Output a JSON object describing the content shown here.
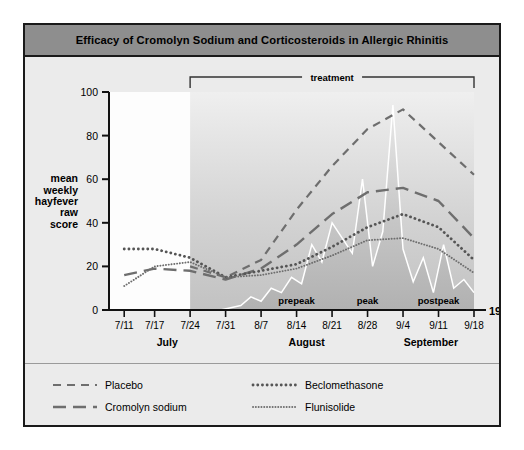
{
  "title": "Efficacy of Cromolyn Sodium and Corticosteroids in Allergic Rhinitis",
  "year_label": "1984",
  "treatment_label": "treatment",
  "y_axis_title_lines": [
    "mean",
    "weekly",
    "hayfever",
    "raw",
    "score"
  ],
  "annotations": [
    {
      "name": "prepeak",
      "label": "prepeak",
      "x": "8/14"
    },
    {
      "name": "peak",
      "label": "peak",
      "x": "8/28"
    },
    {
      "name": "postpeak",
      "label": "postpeak",
      "x": "9/11"
    }
  ],
  "months": [
    {
      "label": "July",
      "start": "7/8",
      "end": "7/31"
    },
    {
      "label": "August",
      "start": "8/1",
      "end": "8/31"
    },
    {
      "label": "September",
      "start": "9/1",
      "end": "9/18"
    }
  ],
  "legend": [
    {
      "name": "Placebo",
      "style": "dashed",
      "color": "#6e6e6e"
    },
    {
      "name": "Beclomethasone",
      "style": "thick-dotted",
      "color": "#5a5a5a"
    },
    {
      "name": "Cromolyn sodium",
      "style": "long-dash",
      "color": "#6e6e6e"
    },
    {
      "name": "Flunisolide",
      "style": "fine-dotted",
      "color": "#6e6e6e"
    }
  ],
  "colors": {
    "frame": "#1a1a1a",
    "titlebar": "#8e8e8e",
    "panel": "#ebebeb",
    "plot_background": "#fdfdfd",
    "pollen_fill": "#b9b9b9",
    "pollen_line": "#ffffff",
    "axis": "#111111"
  },
  "chart_data": {
    "type": "line",
    "title": "Efficacy of Cromolyn Sodium and Corticosteroids in Allergic Rhinitis",
    "xlabel": "1984",
    "ylabel": "mean weekly hayfever raw score",
    "ylim": [
      0,
      100
    ],
    "yticks": [
      0,
      20,
      40,
      60,
      80,
      100
    ],
    "grid": false,
    "legend_position": "below",
    "xlim": [
      "7/8",
      "9/18"
    ],
    "xticks": [
      "7/11",
      "7/17",
      "7/24",
      "7/31",
      "8/7",
      "8/14",
      "8/21",
      "8/28",
      "9/4",
      "9/11",
      "9/18"
    ],
    "x": [
      "7/11",
      "7/17",
      "7/24",
      "7/31",
      "8/7",
      "8/14",
      "8/21",
      "8/28",
      "9/4",
      "9/11",
      "9/18"
    ],
    "series": [
      {
        "name": "Placebo",
        "style": "dashed",
        "x": [
          "7/24",
          "7/31",
          "8/7",
          "8/14",
          "8/21",
          "8/28",
          "9/4",
          "9/11",
          "9/18"
        ],
        "values": [
          20,
          15,
          23,
          46,
          66,
          83,
          92,
          77,
          62
        ]
      },
      {
        "name": "Cromolyn sodium",
        "style": "long-dash",
        "x": [
          "7/11",
          "7/17",
          "7/24",
          "7/31",
          "8/7",
          "8/14",
          "8/21",
          "8/28",
          "9/4",
          "9/11",
          "9/18"
        ],
        "values": [
          16,
          19,
          18,
          14,
          19,
          30,
          44,
          54,
          56,
          50,
          33
        ]
      },
      {
        "name": "Beclomethasone",
        "style": "thick-dotted",
        "x": [
          "7/11",
          "7/17",
          "7/24",
          "7/31",
          "8/7",
          "8/14",
          "8/21",
          "8/28",
          "9/4",
          "9/11",
          "9/18"
        ],
        "values": [
          28,
          28,
          24,
          15,
          18,
          21,
          29,
          38,
          44,
          38,
          23
        ]
      },
      {
        "name": "Flunisolide",
        "style": "fine-dotted",
        "x": [
          "7/11",
          "7/17",
          "7/24",
          "7/31",
          "8/7",
          "8/14",
          "8/21",
          "8/28",
          "9/4",
          "9/11",
          "9/18"
        ],
        "values": [
          11,
          20,
          22,
          15,
          16,
          19,
          25,
          32,
          33,
          28,
          17
        ]
      },
      {
        "name": "pollen count",
        "style": "area-white-line",
        "x": [
          "7/24",
          "7/26",
          "7/28",
          "7/30",
          "8/1",
          "8/3",
          "8/5",
          "8/7",
          "8/9",
          "8/11",
          "8/13",
          "8/15",
          "8/17",
          "8/19",
          "8/21",
          "8/23",
          "8/25",
          "8/27",
          "8/29",
          "8/31",
          "9/2",
          "9/4",
          "9/6",
          "9/8",
          "9/10",
          "9/12",
          "9/14",
          "9/16",
          "9/18"
        ],
        "values": [
          0,
          0,
          0,
          0,
          1,
          2,
          6,
          4,
          10,
          8,
          15,
          12,
          30,
          22,
          40,
          33,
          26,
          60,
          20,
          36,
          94,
          28,
          13,
          24,
          8,
          30,
          10,
          14,
          8
        ]
      }
    ]
  }
}
